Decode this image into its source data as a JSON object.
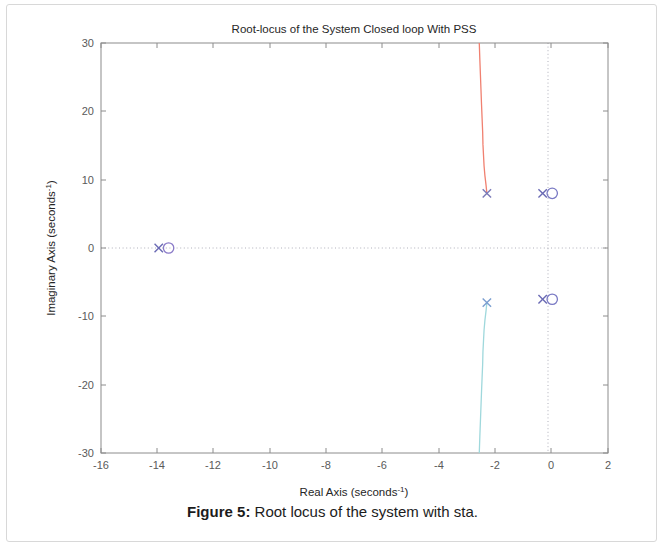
{
  "figure": {
    "caption_label": "Figure 5:",
    "caption_text": " Root locus of the system with sta."
  },
  "chart_data": {
    "type": "line",
    "title": "Root-locus of the System Closed loop With PSS",
    "xlabel": "Real Axis (seconds",
    "xlabel_exp": "-1",
    "xlabel_tail": ")",
    "ylabel": "Imaginary Axis (seconds",
    "ylabel_exp": "-1",
    "ylabel_tail": ")",
    "xlim": [
      -16,
      2
    ],
    "ylim": [
      -30,
      30
    ],
    "xticks": [
      -16,
      -14,
      -12,
      -10,
      -8,
      -6,
      -4,
      -2,
      0,
      2
    ],
    "xtick_labels": [
      "-16",
      "-14",
      "-12",
      "-10",
      "-8",
      "-6",
      "-4",
      "-2",
      "0",
      "2"
    ],
    "yticks": [
      30,
      20,
      10,
      0,
      -10,
      -20,
      -30
    ],
    "ytick_labels": [
      "30",
      "20",
      "10",
      "0",
      "-10",
      "-20",
      "-30"
    ],
    "grid": false,
    "zero_gridlines": {
      "horizontal_at_y": 0,
      "vertical_at_x": 0
    },
    "legend": null,
    "series": [
      {
        "name": "upper-branch",
        "color": "#f08070",
        "points": [
          [
            -2.3,
            8.0
          ],
          [
            -2.33,
            9.2
          ],
          [
            -2.37,
            10.6
          ],
          [
            -2.4,
            12.0
          ],
          [
            -2.42,
            13.6
          ],
          [
            -2.44,
            15.2
          ],
          [
            -2.45,
            17.0
          ],
          [
            -2.47,
            19.0
          ],
          [
            -2.49,
            21.0
          ],
          [
            -2.51,
            23.2
          ],
          [
            -2.53,
            25.4
          ],
          [
            -2.55,
            27.6
          ],
          [
            -2.57,
            30.0
          ]
        ]
      },
      {
        "name": "lower-branch",
        "color": "#9fd8dc",
        "points": [
          [
            -2.3,
            -8.0
          ],
          [
            -2.33,
            -9.2
          ],
          [
            -2.37,
            -10.6
          ],
          [
            -2.4,
            -12.0
          ],
          [
            -2.42,
            -13.6
          ],
          [
            -2.44,
            -15.2
          ],
          [
            -2.45,
            -17.0
          ],
          [
            -2.47,
            -19.0
          ],
          [
            -2.49,
            -21.0
          ],
          [
            -2.51,
            -23.2
          ],
          [
            -2.53,
            -25.4
          ],
          [
            -2.55,
            -27.6
          ],
          [
            -2.57,
            -30.0
          ]
        ]
      }
    ],
    "poles": [
      {
        "x": -2.3,
        "y": 8.0,
        "color": "#7a7ab8"
      },
      {
        "x": -2.3,
        "y": -8.0,
        "color": "#7a9ed0"
      },
      {
        "x": -0.32,
        "y": 8.0,
        "color": "#6a6ab4"
      },
      {
        "x": -0.32,
        "y": -7.5,
        "color": "#6a6ab4"
      },
      {
        "x": -13.95,
        "y": 0.0,
        "color": "#6a6ab4"
      }
    ],
    "zeros": [
      {
        "x": 0.02,
        "y": 8.0,
        "color": "#7a7ac4"
      },
      {
        "x": 0.02,
        "y": -7.5,
        "color": "#7a7ac4"
      },
      {
        "x": -13.6,
        "y": 0.0,
        "color": "#8a7ac8"
      }
    ]
  }
}
